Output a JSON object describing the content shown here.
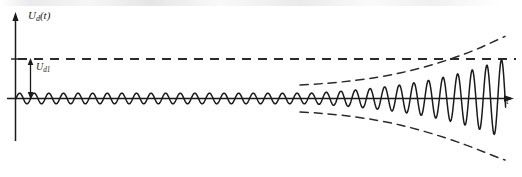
{
  "figure": {
    "title": "",
    "background_color": "#ffffff",
    "stroke_color": "#1a1a1a",
    "width": 522,
    "height": 177
  },
  "labels": {
    "y_axis": {
      "main": "U",
      "subscript": "d",
      "suffix": "(t)"
    },
    "amplitude": {
      "main": "U",
      "subscript": "d1"
    },
    "x_axis": "t"
  },
  "chart_data": {
    "type": "line",
    "title": "Ud(t)",
    "xlabel": "t",
    "ylabel": "Ud(t)",
    "grid": false,
    "legend": "none",
    "annotations": [
      {
        "name": "reference-level-dashed",
        "label": "Ud1",
        "type": "horizontal-dashed-line",
        "y": 1.0,
        "description": "Horizontal dashed reference line marking the Ud1 amplitude level, drawn across the full width of the plot."
      },
      {
        "name": "amplitude-arrow",
        "label": "Ud1",
        "type": "double-headed-vertical-arrow",
        "x": 0.03,
        "y_from": 0.0,
        "y_to": 1.0,
        "description": "Vertical double arrow from the time axis up to the dashed reference line indicating the amplitude Ud1."
      },
      {
        "name": "upper-envelope-dashed",
        "type": "dashed-envelope",
        "description": "Upper dashed exponential envelope diverging from the steady oscillation level."
      },
      {
        "name": "lower-envelope-dashed",
        "type": "dashed-envelope",
        "description": "Lower dashed exponential envelope, mirror image of the upper envelope."
      }
    ],
    "axis": {
      "x_range": [
        0,
        500
      ],
      "y_range": [
        -1.0,
        1.0
      ],
      "x_arrow": true,
      "y_arrow": true,
      "x_ticks": [],
      "y_ticks": [
        {
          "value": 1.0,
          "label": ""
        }
      ]
    },
    "series": [
      {
        "name": "u_d",
        "description": "Oscillation of constant small amplitude that, after roughly 62% of the time axis, grows exponentially until the end of the record.",
        "waveform": "sinusoid",
        "period": 14.6,
        "phase": 0,
        "steady_amplitude": 0.135,
        "growth_start_x": 310,
        "final_amplitude": 1.03,
        "envelope": "exponential"
      }
    ]
  }
}
